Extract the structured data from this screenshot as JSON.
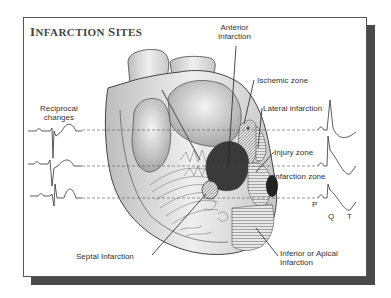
{
  "figure": {
    "title": "Infarction Sites",
    "title_parts": {
      "first_initial": "I",
      "first_rest": "NFARCTION",
      "second_initial": "S",
      "second_rest": "ITES"
    }
  },
  "labels": {
    "anterior": [
      "Anterior",
      "Infarction"
    ],
    "ischemic": "Ischemic zone",
    "lateral": "Lateral infarction",
    "injury": "Injury zone",
    "infarction_zone": "Infarction zone",
    "reciprocal": [
      "Reciprocal",
      "changes"
    ],
    "septal": "Septal Infarction",
    "inferior": [
      "Inferior or Apical",
      "Infarction"
    ]
  },
  "ecg_wave_labels": {
    "p": "P",
    "q": "Q",
    "t": "T"
  },
  "colors": {
    "frame_border": "#555555",
    "shadow": "#4a4a4a",
    "infarct_dark": "#3a3a3a",
    "ink": "#333333",
    "heart_shade": "#cfcfcf"
  }
}
